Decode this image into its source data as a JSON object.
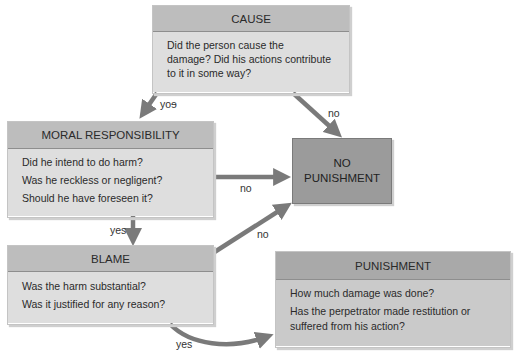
{
  "diagram": {
    "cause": {
      "title": "CAUSE",
      "lines": [
        "Did the person cause the",
        "damage? Did his actions contribute",
        "to it in some way?"
      ]
    },
    "moral": {
      "title": "MORAL RESPONSIBILITY",
      "lines": [
        "Did he intend to do harm?",
        "Was he reckless or negligent?",
        "Should he have foreseen it?"
      ]
    },
    "blame": {
      "title": "BLAME",
      "lines": [
        "Was the harm substantial?",
        "Was it justified for any reason?"
      ]
    },
    "no_punishment": {
      "line1": "NO",
      "line2": "PUNISHMENT"
    },
    "punishment": {
      "title": "PUNISHMENT",
      "lines": [
        "How much damage was done?",
        "Has the perpetrator made restitution or",
        "suffered from his action?"
      ]
    },
    "edges": {
      "cause_to_moral": "yoɘ",
      "cause_to_nop": "no",
      "moral_to_nop": "no",
      "moral_to_blame": "yes",
      "blame_to_nop": "no",
      "blame_to_punishment": "yes"
    },
    "colors": {
      "arrow": "#7a7a7a",
      "header": "#bdbdbd",
      "body": "#dedede",
      "no_punishment_fill": "#9b9b9b"
    }
  }
}
